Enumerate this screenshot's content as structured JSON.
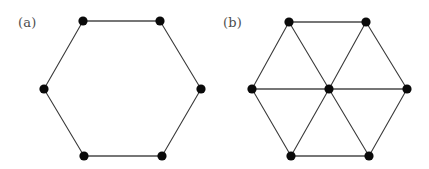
{
  "figure": {
    "background_color": "#ffffff",
    "vertex_color": "#0a0a0a",
    "edge_color": "#3a3a3a",
    "label_color": "#4d4d4d",
    "vertex_radius": 4.6,
    "panels": [
      {
        "id": "panel-a",
        "label": "(a)",
        "label_x": 18,
        "label_y": 27,
        "description": "hexagon cycle",
        "vertices": [
          {
            "id": "a-top-left",
            "x": 83,
            "y": 21
          },
          {
            "id": "a-top-right",
            "x": 160,
            "y": 21
          },
          {
            "id": "a-right",
            "x": 201,
            "y": 89
          },
          {
            "id": "a-bottom-right",
            "x": 162,
            "y": 156
          },
          {
            "id": "a-bottom-left",
            "x": 84,
            "y": 156
          },
          {
            "id": "a-left",
            "x": 44,
            "y": 89
          }
        ],
        "edges": [
          {
            "from": "a-top-left",
            "to": "a-top-right",
            "weight": "thick"
          },
          {
            "from": "a-top-right",
            "to": "a-right",
            "weight": "thin"
          },
          {
            "from": "a-right",
            "to": "a-bottom-right",
            "weight": "thin"
          },
          {
            "from": "a-bottom-right",
            "to": "a-bottom-left",
            "weight": "thick"
          },
          {
            "from": "a-bottom-left",
            "to": "a-left",
            "weight": "thin"
          },
          {
            "from": "a-left",
            "to": "a-top-left",
            "weight": "thin"
          }
        ]
      },
      {
        "id": "panel-b",
        "label": "(b)",
        "label_x": 223,
        "label_y": 27,
        "description": "hexagon cycle with central hub vertex joined to all six rim vertices, forming six triangles",
        "vertices": [
          {
            "id": "b-top-left",
            "x": 289,
            "y": 22
          },
          {
            "id": "b-top-right",
            "x": 366,
            "y": 22
          },
          {
            "id": "b-right",
            "x": 407,
            "y": 89
          },
          {
            "id": "b-bottom-right",
            "x": 369,
            "y": 156
          },
          {
            "id": "b-bottom-left",
            "x": 291,
            "y": 156
          },
          {
            "id": "b-left",
            "x": 252,
            "y": 89
          },
          {
            "id": "b-center",
            "x": 329,
            "y": 89
          }
        ],
        "edges": [
          {
            "from": "b-top-left",
            "to": "b-top-right",
            "weight": "thick"
          },
          {
            "from": "b-top-right",
            "to": "b-right",
            "weight": "thin"
          },
          {
            "from": "b-right",
            "to": "b-bottom-right",
            "weight": "thin"
          },
          {
            "from": "b-bottom-right",
            "to": "b-bottom-left",
            "weight": "thick"
          },
          {
            "from": "b-bottom-left",
            "to": "b-left",
            "weight": "thin"
          },
          {
            "from": "b-left",
            "to": "b-top-left",
            "weight": "thin"
          },
          {
            "from": "b-center",
            "to": "b-top-left",
            "weight": "thin"
          },
          {
            "from": "b-center",
            "to": "b-top-right",
            "weight": "thin"
          },
          {
            "from": "b-center",
            "to": "b-right",
            "weight": "thick"
          },
          {
            "from": "b-center",
            "to": "b-bottom-right",
            "weight": "thin"
          },
          {
            "from": "b-center",
            "to": "b-bottom-left",
            "weight": "thin"
          },
          {
            "from": "b-center",
            "to": "b-left",
            "weight": "thick"
          }
        ]
      }
    ]
  }
}
